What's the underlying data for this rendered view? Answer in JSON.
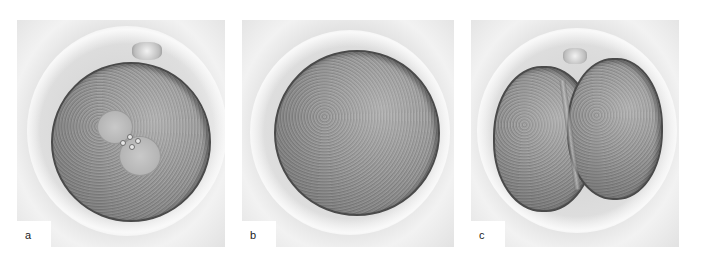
{
  "figure": {
    "panels": [
      {
        "label": "a",
        "description": "Fertilized oocyte with two pronuclei and polar bodies"
      },
      {
        "label": "b",
        "description": "Single-cell oocyte within zona pellucida"
      },
      {
        "label": "c",
        "description": "Two-cell embryo after first cleavage"
      }
    ]
  }
}
